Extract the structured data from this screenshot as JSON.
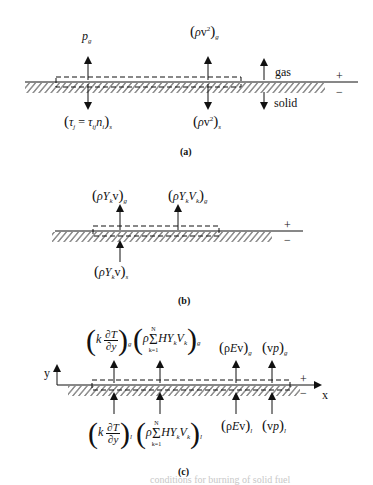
{
  "panels": [
    {
      "id": "a",
      "caption": "(a)",
      "top_labels": {
        "pressure": "p",
        "pressure_sub": "g",
        "momentum": "(ρv²)",
        "momentum_sub": "g"
      },
      "bottom_labels": {
        "stress": "(τ_j = τ_ij n_i)",
        "stress_sub": "s",
        "momentum": "(ρv²)",
        "momentum_sub": "s"
      },
      "side_labels": {
        "gas": "gas",
        "solid": "solid",
        "plus": "+",
        "minus": "−"
      }
    },
    {
      "id": "b",
      "caption": "(b)",
      "top_labels": {
        "convective": "(ρY_k v)",
        "convective_sub": "g",
        "diffusive": "(ρY_k V_k)",
        "diffusive_sub": "g"
      },
      "bottom_labels": {
        "convective": "(ρY_k v)",
        "convective_sub": "s"
      },
      "side_labels": {
        "plus": "+",
        "minus": "−"
      }
    },
    {
      "id": "c",
      "caption": "(c)",
      "top_labels": {
        "conduction": "(k ∂T/∂y)",
        "conduction_sub": "g",
        "species_enthalpy": "(ρ Σ_{k=1}^{N} H Y_k V_k)",
        "species_enthalpy_sub": "g",
        "energy": "(ρEv)",
        "energy_sub": "g",
        "pressure_work": "(vp)",
        "pressure_work_sub": "g"
      },
      "bottom_labels": {
        "conduction": "(k ∂T/∂y)",
        "conduction_sub": "l",
        "species_enthalpy": "(ρ Σ_{k=1}^{N} H Y_k V_k)",
        "species_enthalpy_sub": "l",
        "energy": "(ρEv)",
        "energy_sub": "l",
        "pressure_work": "(vp)",
        "pressure_work_sub": "l"
      },
      "axes": {
        "x": "x",
        "y": "y"
      },
      "side_labels": {
        "plus": "+",
        "minus": "−"
      }
    }
  ],
  "symbols": {
    "rho": "ρ",
    "tau": "τ",
    "sum": "Σ",
    "partial": "∂",
    "k_eq_1": "k=1",
    "N": "N",
    "T": "T",
    "y": "y",
    "k": "k",
    "H": "H",
    "Y": "Y",
    "V": "V",
    "v": "v",
    "E": "E",
    "p": "p"
  },
  "bleed_through": {
    "bottom": "conditions for burning of solid fuel"
  }
}
